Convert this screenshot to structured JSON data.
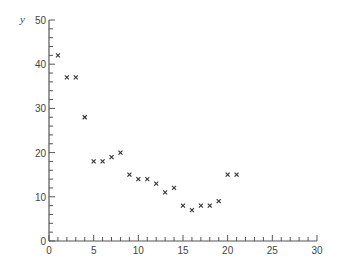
{
  "chart_data": {
    "type": "scatter",
    "title": "",
    "xlabel": "",
    "ylabel": "y",
    "xlim": [
      0,
      30
    ],
    "ylim": [
      0,
      50
    ],
    "grid": false,
    "legend": null,
    "marker": "x",
    "x_ticks": [
      0,
      5,
      10,
      15,
      20,
      25,
      30
    ],
    "x_minor_step": 1,
    "y_ticks": [
      0,
      10,
      20,
      30,
      40,
      50
    ],
    "y_minor_step": 2,
    "x_tick_labels": [
      "0",
      "5",
      "10",
      "15",
      "20",
      "25",
      "30"
    ],
    "y_tick_labels": [
      "0",
      "10",
      "20",
      "30",
      "40",
      "50"
    ],
    "series": [
      {
        "name": "y",
        "x": [
          1,
          2,
          3,
          4,
          5,
          6,
          7,
          8,
          9,
          10,
          11,
          12,
          13,
          14,
          15,
          16,
          17,
          18,
          19,
          20,
          21
        ],
        "y": [
          42,
          37,
          37,
          28,
          18,
          18,
          19,
          20,
          15,
          14,
          14,
          13,
          11,
          12,
          8,
          7,
          8,
          8,
          9,
          15,
          15
        ]
      }
    ]
  },
  "plot": {
    "origin_px": [
      49,
      241
    ],
    "x_px_per_unit": 8.933,
    "y_px_per_unit": 4.42
  }
}
